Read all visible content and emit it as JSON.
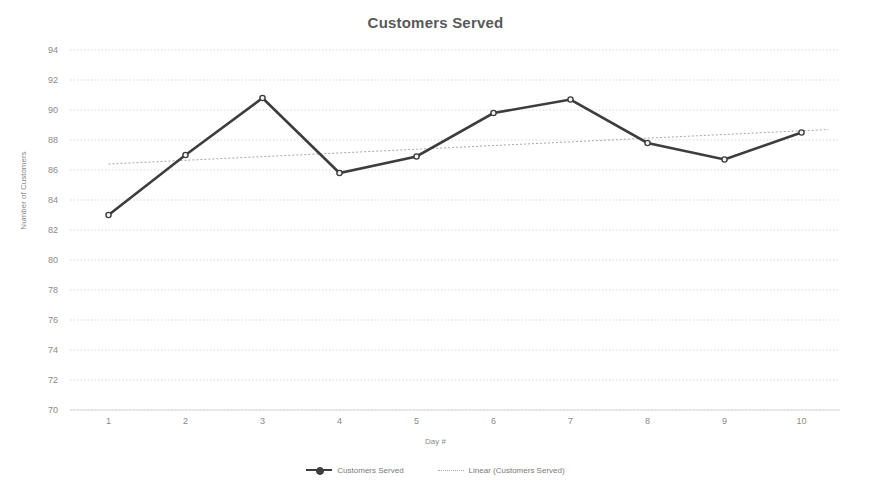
{
  "chart_data": {
    "type": "line",
    "title": "Customers Served",
    "xlabel": "Day #",
    "ylabel": "Number of Customers",
    "x": [
      1,
      2,
      3,
      4,
      5,
      6,
      7,
      8,
      9,
      10
    ],
    "xtick_labels": [
      "1",
      "2",
      "3",
      "4",
      "5",
      "6",
      "7",
      "8",
      "9",
      "10"
    ],
    "ytick_labels": [
      "94",
      "92",
      "90",
      "88",
      "86",
      "84",
      "82",
      "80",
      "78",
      "76",
      "74",
      "72",
      "70"
    ],
    "yticks": [
      94,
      92,
      90,
      88,
      86,
      84,
      82,
      80,
      78,
      76,
      74,
      72,
      70
    ],
    "ylim": [
      70,
      94
    ],
    "xlim": [
      0.5,
      10.5
    ],
    "grid": "horizontal-dotted",
    "legend_position": "bottom",
    "series": [
      {
        "name": "Customers Served",
        "style": "solid-with-markers",
        "color": "#3d3d3d",
        "values": [
          83,
          87,
          90.8,
          85.8,
          86.9,
          89.8,
          90.7,
          87.8,
          86.7,
          88.5
        ]
      },
      {
        "name": "Linear (Customers Served)",
        "style": "dotted-trendline",
        "color": "#a8a8a8",
        "endpoints": [
          {
            "x": 1,
            "y": 86.4
          },
          {
            "x": 10.35,
            "y": 88.7
          }
        ]
      }
    ],
    "colors": {
      "series_line": "#3d3d3d",
      "trendline": "#a8a8a8",
      "gridline": "#d9d9d9",
      "axis_text": "#8a8a8a",
      "title_text": "#595959",
      "background": "#ffffff"
    }
  },
  "legend": {
    "entries": [
      {
        "label": "Customers Served"
      },
      {
        "label": "Linear (Customers Served)"
      }
    ]
  }
}
